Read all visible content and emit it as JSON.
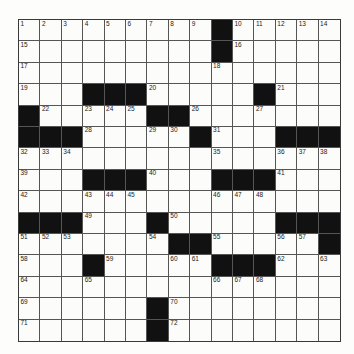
{
  "puzzle": {
    "size": 15,
    "colors": {
      "block": "#111111",
      "cell": "#fcfcfa",
      "line": "#555555"
    },
    "rows": [
      [
        "1",
        "2",
        "3",
        "4",
        "5",
        "6",
        "7",
        "8",
        "9",
        "#",
        "10",
        "11",
        "12",
        "13",
        "14"
      ],
      [
        "15",
        "",
        "",
        "",
        "",
        "",
        "",
        "",
        "",
        "#",
        "16",
        "",
        "",
        "",
        ""
      ],
      [
        "17",
        "",
        "",
        "",
        "",
        "",
        "",
        "",
        "",
        "18",
        "",
        "",
        "",
        "",
        ""
      ],
      [
        "19",
        "",
        "",
        "#",
        "#",
        "#",
        "20",
        "",
        "",
        "",
        "",
        "#",
        "21",
        "",
        ""
      ],
      [
        "#",
        "22",
        "",
        "23",
        "24",
        "25",
        "#",
        "#",
        "26",
        "",
        "",
        "27",
        "",
        "",
        ""
      ],
      [
        "#",
        "#",
        "#",
        "28",
        "",
        "",
        "29",
        "30",
        "#",
        "31",
        "",
        "",
        "#",
        "#",
        "#"
      ],
      [
        "32",
        "33",
        "34",
        "",
        "",
        "",
        "",
        "",
        "",
        "35",
        "",
        "",
        "36",
        "37",
        "38"
      ],
      [
        "39",
        "",
        "",
        "#",
        "#",
        "#",
        "40",
        "",
        "",
        "#",
        "#",
        "#",
        "41",
        "",
        ""
      ],
      [
        "42",
        "",
        "",
        "43",
        "44",
        "45",
        "",
        "",
        "",
        "46",
        "47",
        "48",
        "",
        "",
        ""
      ],
      [
        "#",
        "#",
        "#",
        "49",
        "",
        "",
        "#",
        "50",
        "",
        "",
        "",
        "",
        "#",
        "#",
        "#"
      ],
      [
        "51",
        "52",
        "53",
        "",
        "",
        "",
        "54",
        "#",
        "#",
        "55",
        "",
        "",
        "56",
        "57",
        "#"
      ],
      [
        "58",
        "",
        "",
        "#",
        "59",
        "",
        "",
        "60",
        "61",
        "#",
        "#",
        "#",
        "62",
        "",
        "63"
      ],
      [
        "64",
        "",
        "",
        "65",
        "",
        "",
        "",
        "",
        "",
        "66",
        "67",
        "68",
        "",
        "",
        ""
      ],
      [
        "69",
        "",
        "",
        "",
        "",
        "",
        "#",
        "70",
        "",
        "",
        "",
        "",
        "",
        "",
        ""
      ],
      [
        "71",
        "",
        "",
        "",
        "",
        "",
        "#",
        "72",
        "",
        "",
        "",
        "",
        "",
        "",
        ""
      ]
    ]
  }
}
